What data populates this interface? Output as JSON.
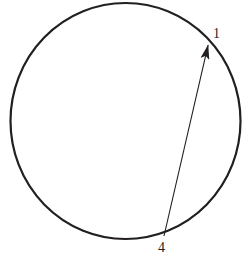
{
  "figure": {
    "background_color": "#ffffff",
    "width": 251,
    "height": 261,
    "circle": {
      "name": "circle-outline",
      "center_x": 125.5,
      "center_y": 121,
      "radius_x": 115,
      "radius_y": 118,
      "stroke_color": "#231f20",
      "stroke_width": 2.2,
      "fill": "none"
    },
    "arrow": {
      "name": "chord-arrow",
      "from_x": 164,
      "from_y": 236,
      "to_x": 209.5,
      "to_y": 39,
      "stroke_color": "#231f20",
      "stroke_width": 1.1,
      "head_length": 15,
      "head_width": 9,
      "direction": "from-4-to-1"
    },
    "labels": [
      {
        "name": "endpoint-label-1",
        "text": "1",
        "x": 216,
        "y": 34,
        "color": "#231f20"
      },
      {
        "name": "endpoint-label-4",
        "text": "4",
        "x": 163,
        "y": 248,
        "color": "#231f20"
      }
    ]
  }
}
